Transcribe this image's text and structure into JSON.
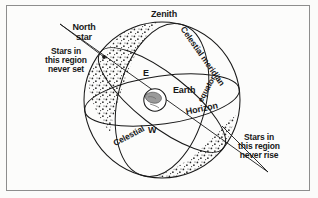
{
  "figure": {
    "type": "celestial-sphere-diagram",
    "background_color": "#fcfcfb",
    "ink_color": "#181818",
    "border_color": "#8d8d8d"
  },
  "labels": {
    "zenith": "Zenith",
    "north_star": "North\nstar",
    "celestial_meridian": "Celestial meridian",
    "celestial_equator_word1": "Celestial",
    "celestial_equator_word2": "equator",
    "horizon": "Horizon",
    "earth": "Earth",
    "east": "E",
    "west": "W",
    "never_set": "Stars in\nthis region\nnever set",
    "never_rise": "Stars in\nthis region\nnever rise"
  },
  "geometry": {
    "sphere_center_x": 162,
    "sphere_center_y": 100,
    "sphere_radius": 78,
    "earth_center_x": 155,
    "earth_center_y": 100,
    "earth_radius": 11,
    "pole_x": 104,
    "pole_y": 57,
    "axis_tilt_degrees": 40
  },
  "regions": [
    {
      "name": "circumpolar-never-set",
      "label": "Stars in this region never set",
      "stipple": true
    },
    {
      "name": "never-rise",
      "label": "Stars in this region never rise",
      "stipple": true
    }
  ]
}
